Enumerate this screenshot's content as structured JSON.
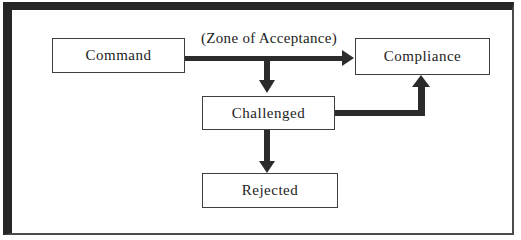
{
  "figure": {
    "annotation": "(Zone of Acceptance)",
    "nodes": {
      "command": "Command",
      "compliance": "Compliance",
      "challenged": "Challenged",
      "rejected": "Rejected"
    },
    "edges": [
      {
        "from": "command",
        "to": "compliance",
        "label": "(Zone of Acceptance)"
      },
      {
        "from": "command-compliance-arrow",
        "to": "challenged",
        "label": ""
      },
      {
        "from": "challenged",
        "to": "compliance",
        "label": ""
      },
      {
        "from": "challenged",
        "to": "rejected",
        "label": ""
      }
    ],
    "colors": {
      "frame": "#262626",
      "frame_light": "#4b4b4b",
      "arrow": "#2b2b2b",
      "box_border": "#3f3f3f",
      "background": "#ffffff",
      "text": "#1c1c1c"
    }
  }
}
